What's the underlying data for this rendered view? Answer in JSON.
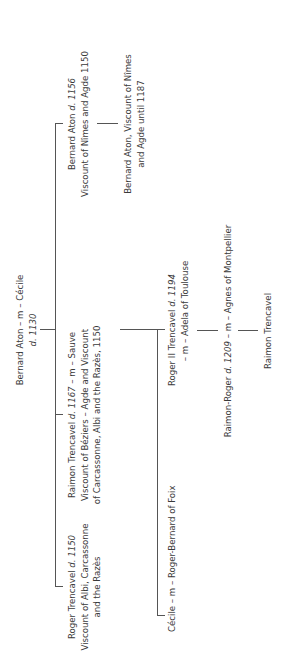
{
  "diagram": {
    "type": "family-tree",
    "orientation": "rotated-90-ccw",
    "root": {
      "line1": "Bernard Aton – m – Cécile",
      "line2": "d. 1130"
    },
    "children": [
      {
        "id": "roger-trencavel",
        "name": "Roger Trencavel",
        "died": "d. 1150",
        "line2": "Viscount of Albi, Carcassonne",
        "line3": "and the Razès"
      },
      {
        "id": "raimon-trencavel",
        "name": "Raimon Trencavel",
        "died": "d. 1167",
        "spouse": "– m – Sauve",
        "line2": "Viscount of Béziers – Agde and Viscount",
        "line3": "of Carcassonne, Albi and the Razès, 1150"
      },
      {
        "id": "bernard-aton-1156",
        "name": "Bernard Aton",
        "died": "d. 1156",
        "line2": "Viscount of Nîmes and Agde 1150"
      }
    ],
    "grandchildren": [
      {
        "id": "cecile",
        "line1": "Cécile – m – Roger-Bernard of Foix"
      },
      {
        "id": "roger-ii",
        "name": "Roger II Trencavel",
        "died": "d. 1194",
        "line2": "– m – Adela of Toulouse"
      },
      {
        "id": "bernard-aton-son",
        "line1": "Bernard Aton, Viscount of Nîmes",
        "line2": "and Agde until 1187"
      }
    ],
    "great_grandchild": {
      "name": "Raimon-Roger",
      "died": "d. 1209",
      "spouse": "– m – Agnes of Montpellier"
    },
    "great_great_grandchild": {
      "name": "Raimon Trencavel"
    }
  }
}
